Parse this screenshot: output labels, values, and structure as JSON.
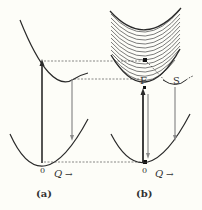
{
  "figure": {
    "panels": [
      {
        "id": "a",
        "caption": "(a)",
        "origin_label": "0",
        "axis_label": "Q",
        "axis_arrow": "→"
      },
      {
        "id": "b",
        "caption": "(b)",
        "origin_label": "0",
        "axis_label": "Q",
        "axis_arrow": "→",
        "point_labels": {
          "F": "F",
          "S": "S"
        }
      }
    ],
    "colors": {
      "background": "#fdfdf8",
      "curve": "#2a2a2a",
      "emission_arrow": "#8a8a8a",
      "dashed": "#555555",
      "hatch": "#444444"
    }
  }
}
